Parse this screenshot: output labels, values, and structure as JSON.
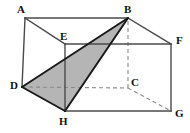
{
  "figure": {
    "width": 190,
    "height": 133,
    "background_color": "#ffffff",
    "edge_color": "#4a4a4a",
    "edge_dark_color": "#1a1a1a",
    "dashed_color": "#8a8a8a",
    "shade_color": "#b5b5b5",
    "label_color": "#111111"
  },
  "vertices": [
    {
      "name": "A",
      "label": "A",
      "x": 25,
      "y": 18,
      "label_x": 17,
      "label_y": 4,
      "hidden": false
    },
    {
      "name": "B",
      "label": "B",
      "x": 128,
      "y": 18,
      "label_x": 124,
      "label_y": 4,
      "hidden": false
    },
    {
      "name": "C",
      "label": "C",
      "x": 128,
      "y": 88,
      "label_x": 131,
      "label_y": 77,
      "hidden": true
    },
    {
      "name": "D",
      "label": "D",
      "x": 22,
      "y": 87,
      "label_x": 10,
      "label_y": 80,
      "hidden": false
    },
    {
      "name": "E",
      "label": "E",
      "x": 65,
      "y": 44,
      "label_x": 60,
      "label_y": 31,
      "hidden": false
    },
    {
      "name": "F",
      "label": "F",
      "x": 171,
      "y": 44,
      "label_x": 176,
      "label_y": 35,
      "hidden": false
    },
    {
      "name": "G",
      "label": "G",
      "x": 171,
      "y": 111,
      "label_x": 175,
      "label_y": 108,
      "hidden": false
    },
    {
      "name": "H",
      "label": "H",
      "x": 65,
      "y": 111,
      "label_x": 59,
      "label_y": 116,
      "hidden": false
    }
  ],
  "edges": {
    "solid": [
      {
        "name": "edge-AB",
        "from": "A",
        "to": "B",
        "style": "solid",
        "weight": "thin"
      },
      {
        "name": "edge-AD",
        "from": "A",
        "to": "D",
        "style": "solid",
        "weight": "thin"
      },
      {
        "name": "edge-AE",
        "from": "A",
        "to": "E",
        "style": "solid",
        "weight": "thin"
      },
      {
        "name": "edge-EF",
        "from": "E",
        "to": "F",
        "style": "solid",
        "weight": "thin"
      },
      {
        "name": "edge-EH",
        "from": "E",
        "to": "H",
        "style": "solid",
        "weight": "thin"
      },
      {
        "name": "edge-BF",
        "from": "B",
        "to": "F",
        "style": "solid",
        "weight": "thin"
      },
      {
        "name": "edge-FG",
        "from": "F",
        "to": "G",
        "style": "solid",
        "weight": "thin"
      },
      {
        "name": "edge-HG",
        "from": "H",
        "to": "G",
        "style": "solid",
        "weight": "thin"
      },
      {
        "name": "edge-DH",
        "from": "D",
        "to": "H",
        "style": "solid",
        "weight": "bold"
      },
      {
        "name": "edge-DB",
        "from": "D",
        "to": "B",
        "style": "solid",
        "weight": "bold"
      },
      {
        "name": "edge-BH",
        "from": "B",
        "to": "H",
        "style": "solid",
        "weight": "bold"
      }
    ],
    "dashed": [
      {
        "name": "edge-DC",
        "from": "D",
        "to": "C",
        "style": "dashed"
      },
      {
        "name": "edge-CB",
        "from": "C",
        "to": "B",
        "style": "dashed"
      },
      {
        "name": "edge-CG",
        "from": "C",
        "to": "G",
        "style": "dashed"
      }
    ]
  },
  "shaded_faces": [
    {
      "name": "triangle-DBH",
      "vertices": [
        "D",
        "B",
        "H"
      ],
      "fill": "#b5b5b5",
      "points": "22,87 128,18 65,111"
    }
  ]
}
